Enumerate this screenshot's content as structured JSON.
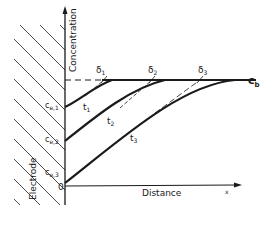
{
  "figure": {
    "y_axis_label": "Concentration",
    "x_axis_label": "Distance",
    "x_symbol": "x",
    "origin_label": "0",
    "electrode_label": "Electrode",
    "bulk_label": {
      "main": "c",
      "sub": "b"
    },
    "surface_concentrations": [
      {
        "main": "c",
        "sub": "e,1"
      },
      {
        "main": "c",
        "sub": "e,2"
      },
      {
        "main": "c",
        "sub": "e,3"
      }
    ],
    "diffusion_layers": [
      {
        "main": "δ",
        "sub": "1"
      },
      {
        "main": "δ",
        "sub": "2"
      },
      {
        "main": "δ",
        "sub": "3"
      }
    ],
    "times": [
      {
        "main": "t",
        "sub": "1"
      },
      {
        "main": "t",
        "sub": "2"
      },
      {
        "main": "t",
        "sub": "3"
      }
    ],
    "colors": {
      "ink": "#1a1a1a",
      "background": "#ffffff"
    }
  }
}
